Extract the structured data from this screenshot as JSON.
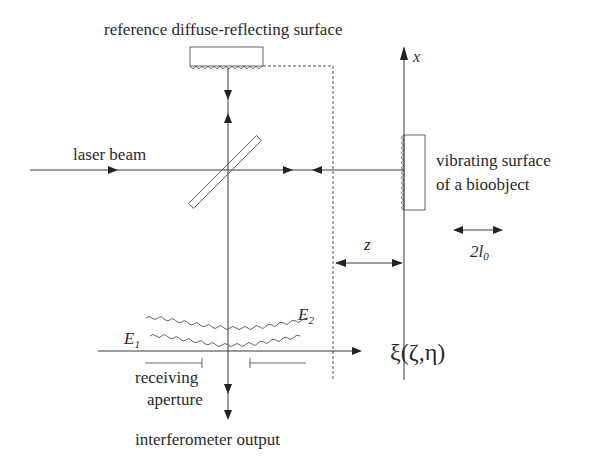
{
  "diagram": {
    "labels": {
      "reference_surface": "reference diffuse-reflecting surface",
      "laser_beam": "laser beam",
      "bioobject_line1": "vibrating surface",
      "bioobject_line2": "of a bioobject",
      "x_axis": "x",
      "z_distance": "z",
      "amplitude_main": "2l",
      "amplitude_sub": "0",
      "e1_main": "E",
      "e1_sub": "1",
      "e2_main": "E",
      "e2_sub": "2",
      "plane_coords": "ξ(ζ,η)",
      "aperture_line1": "receiving",
      "aperture_line2": "aperture",
      "output": "interferometer output"
    },
    "components": [
      {
        "name": "reference-surface",
        "type": "diffuse reflector (rectangle with wavy edge)"
      },
      {
        "name": "beam-splitter",
        "type": "tilted plate at 45°"
      },
      {
        "name": "bioobject",
        "type": "vibrating surface (rectangle with wavy edge)"
      },
      {
        "name": "receiving-aperture",
        "type": "aperture on observation plane"
      }
    ],
    "colors": {
      "line": "#3a3a3a",
      "text": "#2a2a2a",
      "background": "#ffffff"
    }
  }
}
